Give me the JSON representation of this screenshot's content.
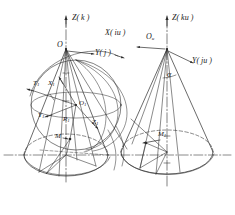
{
  "figure": {
    "type": "engineering-line-diagram",
    "stroke_color": "#2b2b2b",
    "background": "#ffffff",
    "axis_line_style": "dash-dot centerline"
  },
  "left_assembly": {
    "name": "left-cone-with-circumscribed-sphere",
    "apex_label": "O",
    "center_label": "O",
    "center_sub": "1",
    "axis_z_label": "Z( k )",
    "axis_y_label": "Y( j )",
    "axis_x_label": "X( iu )",
    "tangent_label": "T",
    "tangent_sub": "1",
    "x1_label": "X",
    "x1_sub": "1",
    "y1_label": "Y",
    "y1_sub": "1",
    "z1_label": "Z",
    "z1_sub": "1",
    "radius_label": "R",
    "radius_sub": "1",
    "point_m_label": "M"
  },
  "right_assembly": {
    "name": "right-cone",
    "apex_label": "O",
    "apex_sub": "u",
    "axis_z_label": "Z( ku )",
    "axis_y_label": "Y( ju )",
    "angle_label": "α",
    "point_m_label": "M",
    "point_m_sub": "1"
  }
}
